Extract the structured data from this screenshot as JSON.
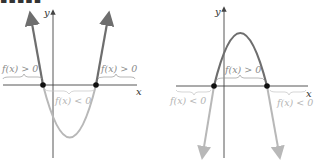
{
  "heading_fragment": "▪▪▪▪▪",
  "colors": {
    "dark_curve": "#6e6e6e",
    "light_curve": "#b8b8b8",
    "axis": "#444444",
    "point": "#111111",
    "label_dark": "#8a8a8a",
    "label_light": "#c4c4c4"
  },
  "graphs": [
    {
      "name": "upward-parabola",
      "x_axis_label": "x",
      "y_axis_label": "y",
      "labels": {
        "left_positive": "f(x) > 0",
        "right_positive": "f(x) > 0",
        "middle_negative": "f(x) < 0"
      }
    },
    {
      "name": "downward-parabola",
      "x_axis_label": "x",
      "y_axis_label": "y",
      "labels": {
        "middle_positive": "f(x) > 0",
        "left_negative": "f(x) < 0",
        "right_negative": "f(x) < 0"
      }
    }
  ]
}
